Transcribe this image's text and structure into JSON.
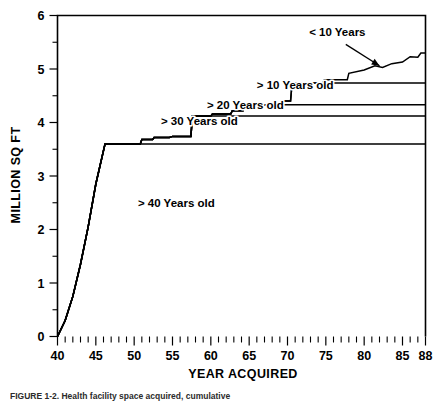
{
  "chart_data": {
    "type": "line",
    "title": "",
    "xlabel": "YEAR ACQUIRED",
    "ylabel": "MILLION SQ FT",
    "xlim": [
      40,
      88
    ],
    "ylim": [
      0,
      6
    ],
    "grid": false,
    "legend_position": "inline-labels",
    "x_ticks": [
      40,
      45,
      50,
      55,
      60,
      65,
      70,
      75,
      80,
      85,
      88
    ],
    "x_tick_labels": [
      "40",
      "45",
      "50",
      "55",
      "60",
      "65",
      "70",
      "75",
      "80",
      "85",
      "88"
    ],
    "x_minor_tick_step": 1,
    "y_ticks": [
      0,
      1,
      2,
      3,
      4,
      5,
      6
    ],
    "y_tick_labels": [
      "0",
      "1",
      "2",
      "3",
      "4",
      "5",
      "6"
    ],
    "y_minor_tick_step": 0.5,
    "annotations": [
      {
        "text": "< 10 Years",
        "x": 76.5,
        "y": 5.62,
        "arrow_from_x": 77.6,
        "arrow_from_y": 5.46,
        "arrow_to_x": 82.0,
        "arrow_to_y": 5.06
      }
    ],
    "series": [
      {
        "name": "< 10 Years",
        "label": "< 10 Years",
        "label_x": 76.5,
        "label_y": 5.62,
        "points": [
          [
            40.0,
            0.0
          ],
          [
            41.0,
            0.3
          ],
          [
            42.0,
            0.75
          ],
          [
            43.0,
            1.35
          ],
          [
            44.0,
            2.05
          ],
          [
            45.0,
            2.85
          ],
          [
            46.2,
            3.6
          ],
          [
            50.8,
            3.6
          ],
          [
            51.0,
            3.68
          ],
          [
            52.4,
            3.68
          ],
          [
            52.6,
            3.72
          ],
          [
            54.6,
            3.72
          ],
          [
            55.0,
            3.74
          ],
          [
            57.4,
            3.74
          ],
          [
            57.6,
            4.12
          ],
          [
            60.0,
            4.12
          ],
          [
            60.2,
            4.16
          ],
          [
            62.6,
            4.16
          ],
          [
            62.8,
            4.22
          ],
          [
            64.2,
            4.22
          ],
          [
            64.4,
            4.33
          ],
          [
            69.3,
            4.33
          ],
          [
            69.5,
            4.4
          ],
          [
            70.4,
            4.4
          ],
          [
            70.6,
            4.74
          ],
          [
            74.6,
            4.74
          ],
          [
            74.8,
            4.8
          ],
          [
            77.8,
            4.8
          ],
          [
            78.0,
            4.92
          ],
          [
            80.0,
            4.98
          ],
          [
            81.4,
            5.06
          ],
          [
            82.4,
            5.03
          ],
          [
            83.6,
            5.1
          ],
          [
            85.0,
            5.13
          ],
          [
            86.0,
            5.23
          ],
          [
            87.0,
            5.22
          ],
          [
            87.4,
            5.3
          ],
          [
            88.0,
            5.3
          ]
        ]
      },
      {
        "name": "> 10 Years old",
        "label": "> 10 Years old",
        "label_x": 71.0,
        "label_y": 4.62,
        "points": [
          [
            40.0,
            0.0
          ],
          [
            41.0,
            0.3
          ],
          [
            42.0,
            0.75
          ],
          [
            43.0,
            1.35
          ],
          [
            44.0,
            2.05
          ],
          [
            45.0,
            2.85
          ],
          [
            46.2,
            3.6
          ],
          [
            50.8,
            3.6
          ],
          [
            51.0,
            3.68
          ],
          [
            52.4,
            3.68
          ],
          [
            52.6,
            3.72
          ],
          [
            54.6,
            3.72
          ],
          [
            55.0,
            3.74
          ],
          [
            57.4,
            3.74
          ],
          [
            57.6,
            4.12
          ],
          [
            60.0,
            4.12
          ],
          [
            60.2,
            4.16
          ],
          [
            62.6,
            4.16
          ],
          [
            62.8,
            4.22
          ],
          [
            64.2,
            4.22
          ],
          [
            64.4,
            4.33
          ],
          [
            69.3,
            4.33
          ],
          [
            69.5,
            4.4
          ],
          [
            70.4,
            4.4
          ],
          [
            70.6,
            4.74
          ],
          [
            88.0,
            4.74
          ]
        ]
      },
      {
        "name": "> 20 Years old",
        "label": "> 20 Years old",
        "label_x": 64.5,
        "label_y": 4.25,
        "points": [
          [
            40.0,
            0.0
          ],
          [
            41.0,
            0.3
          ],
          [
            42.0,
            0.75
          ],
          [
            43.0,
            1.35
          ],
          [
            44.0,
            2.05
          ],
          [
            45.0,
            2.85
          ],
          [
            46.2,
            3.6
          ],
          [
            50.8,
            3.6
          ],
          [
            51.0,
            3.68
          ],
          [
            52.4,
            3.68
          ],
          [
            52.6,
            3.72
          ],
          [
            54.6,
            3.72
          ],
          [
            55.0,
            3.74
          ],
          [
            57.4,
            3.74
          ],
          [
            57.6,
            4.12
          ],
          [
            60.0,
            4.12
          ],
          [
            60.2,
            4.16
          ],
          [
            62.6,
            4.16
          ],
          [
            62.8,
            4.22
          ],
          [
            64.2,
            4.22
          ],
          [
            64.4,
            4.33
          ],
          [
            88.0,
            4.33
          ]
        ]
      },
      {
        "name": "> 30 Years old",
        "label": "> 30 Years old",
        "label_x": 58.5,
        "label_y": 3.95,
        "points": [
          [
            40.0,
            0.0
          ],
          [
            41.0,
            0.3
          ],
          [
            42.0,
            0.75
          ],
          [
            43.0,
            1.35
          ],
          [
            44.0,
            2.05
          ],
          [
            45.0,
            2.85
          ],
          [
            46.2,
            3.6
          ],
          [
            50.8,
            3.6
          ],
          [
            51.0,
            3.68
          ],
          [
            52.4,
            3.68
          ],
          [
            52.6,
            3.72
          ],
          [
            54.6,
            3.72
          ],
          [
            55.0,
            3.74
          ],
          [
            57.4,
            3.74
          ],
          [
            57.6,
            4.12
          ],
          [
            88.0,
            4.12
          ]
        ]
      },
      {
        "name": "> 40 Years old",
        "label": "> 40 Years old",
        "label_x": 55.5,
        "label_y": 2.42,
        "points": [
          [
            40.0,
            0.0
          ],
          [
            41.0,
            0.3
          ],
          [
            42.0,
            0.75
          ],
          [
            43.0,
            1.35
          ],
          [
            44.0,
            2.05
          ],
          [
            45.0,
            2.85
          ],
          [
            46.2,
            3.6
          ],
          [
            88.0,
            3.6
          ]
        ]
      }
    ]
  },
  "caption": {
    "text": "FIGURE 1-2. Health facility space acquired, cumulative"
  }
}
